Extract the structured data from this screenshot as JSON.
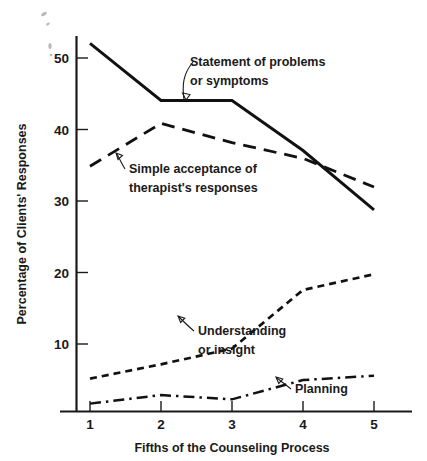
{
  "chart_data": {
    "type": "line",
    "title": "",
    "xlabel": "Fifths of the Counseling Process",
    "ylabel": "Percentage of Clients' Responses",
    "x": [
      1,
      2,
      3,
      4,
      5
    ],
    "xticklabels": [
      "1",
      "2",
      "3",
      "4",
      "5"
    ],
    "yticks": [
      10,
      20,
      30,
      40,
      50
    ],
    "yticklabels": [
      "10",
      "20",
      "30",
      "40",
      "50"
    ],
    "xlim": [
      0.75,
      5.3
    ],
    "ylim": [
      0,
      54
    ],
    "grid": false,
    "legend_position": "inline-annotations",
    "series": [
      {
        "name": "Statement of problems or symptoms",
        "style": "solid",
        "values": [
          51.5,
          43.5,
          43.5,
          36.5,
          28.2
        ]
      },
      {
        "name": "Simple acceptance of therapist's responses",
        "style": "long-dashed",
        "values": [
          34.3,
          40.3,
          37.6,
          35.4,
          31.4
        ]
      },
      {
        "name": "Understanding or insight",
        "style": "short-dashed",
        "values": [
          4.6,
          6.6,
          8.8,
          17.0,
          19.2
        ]
      },
      {
        "name": "Planning",
        "style": "dash-dot",
        "values": [
          1.1,
          2.3,
          1.7,
          4.4,
          5.0
        ]
      }
    ],
    "annotations": [
      {
        "id": "statement",
        "lines": [
          "Statement of problems",
          "or symptoms"
        ],
        "text": "Statement of problems or symptoms"
      },
      {
        "id": "acceptance",
        "lines": [
          "Simple acceptance of",
          "therapist's responses"
        ],
        "text": "Simple acceptance of therapist's responses"
      },
      {
        "id": "understanding",
        "lines": [
          "Understanding",
          "or insight"
        ],
        "text": "Understanding or insight"
      },
      {
        "id": "planning",
        "lines": [
          "Planning"
        ],
        "text": "Planning"
      }
    ],
    "colors": {
      "ink": "#111111",
      "background": "#ffffff"
    }
  }
}
